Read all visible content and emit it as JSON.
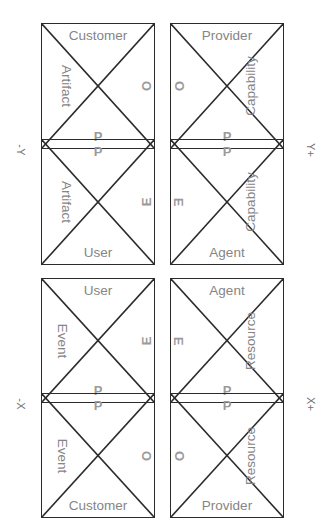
{
  "diagram": {
    "axes": [
      {
        "name": "minus-y",
        "label": "-Y",
        "position": "left-top"
      },
      {
        "name": "plus-y",
        "label": "Y+",
        "position": "right-top"
      },
      {
        "name": "minus-x",
        "label": "-X",
        "position": "left-bottom"
      },
      {
        "name": "plus-x",
        "label": "X+",
        "position": "right-bottom"
      }
    ],
    "colors": {
      "stroke": "#2b2b2b",
      "word_text": "#858585",
      "glyph_text": "#9a9a9a",
      "axis_text": "#6f6f6f",
      "background": "#ffffff"
    },
    "groups": [
      {
        "name": "top-left-group",
        "cells": [
          {
            "name": "cell-customer-artifact",
            "top": "Customer",
            "left": "Artifact",
            "right": "O",
            "bottom": "P"
          },
          {
            "name": "cell-user-artifact",
            "top": "P",
            "left": "Artifact",
            "right": "E",
            "bottom": "User"
          }
        ]
      },
      {
        "name": "top-right-group",
        "cells": [
          {
            "name": "cell-provider-capability",
            "top": "Provider",
            "left": "O",
            "right": "Capability",
            "bottom": "P"
          },
          {
            "name": "cell-agent-capability",
            "top": "P",
            "left": "E",
            "right": "Capability",
            "bottom": "Agent"
          }
        ]
      },
      {
        "name": "bottom-left-group",
        "cells": [
          {
            "name": "cell-user-event",
            "top": "User",
            "left": "Event",
            "right": "E",
            "bottom": "P"
          },
          {
            "name": "cell-customer-event",
            "top": "P",
            "left": "Event",
            "right": "O",
            "bottom": "Customer"
          }
        ]
      },
      {
        "name": "bottom-right-group",
        "cells": [
          {
            "name": "cell-agent-resource",
            "top": "Agent",
            "left": "E",
            "right": "Resource",
            "bottom": "P"
          },
          {
            "name": "cell-provider-resource",
            "top": "P",
            "left": "O",
            "right": "Resource",
            "bottom": "Provider"
          }
        ]
      }
    ]
  }
}
